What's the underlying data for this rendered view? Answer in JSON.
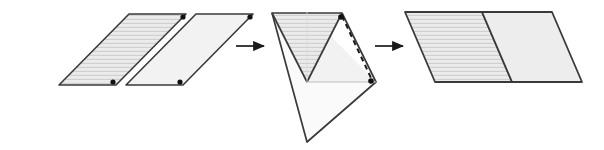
{
  "figure": {
    "type": "geometry-dissection-diagram",
    "caption": "",
    "canvas": {
      "width": 604,
      "height": 150,
      "background": "#ffffff"
    },
    "colors": {
      "outline": "#3a3a3a",
      "fill_plain": "#efefef",
      "fill_hatched": "#e9e9e9",
      "fill_pale": "#f7f7f7",
      "hatch_line": "#c9c9c9",
      "vertex_dot": "#111111",
      "arrow": "#1a1a1a",
      "dashed_line": "#1a1a1a"
    },
    "stages": [
      {
        "id": "stage-1",
        "label": "two separate parallelograms",
        "shapes": [
          {
            "id": "parallelogram-hatched-start",
            "name": "hatched-parallelogram",
            "fill": "hatched",
            "points": "59,85 129,14 186,14 116,85",
            "dots": [
              {
                "name": "vertex-dot-top-right",
                "cx": 183,
                "cy": 17
              },
              {
                "name": "vertex-dot-bottom-right",
                "cx": 113,
                "cy": 82
              }
            ]
          },
          {
            "id": "parallelogram-plain-start",
            "name": "plain-parallelogram",
            "fill": "plain",
            "points": "126,85 196,14 253,14 183,85",
            "dots": [
              {
                "name": "vertex-dot-top-right",
                "cx": 250,
                "cy": 17
              },
              {
                "name": "vertex-dot-bottom-right",
                "cx": 180,
                "cy": 82
              }
            ]
          }
        ]
      },
      {
        "id": "arrow-1",
        "label": "transform arrow one",
        "x1": 236,
        "y1": 46,
        "x2": 266,
        "y2": 46
      },
      {
        "id": "stage-2",
        "label": "rotated overlapping triangles with fold line",
        "shapes": [
          {
            "id": "triangle-pale-lower",
            "name": "pale-lower-triangle",
            "fill": "pale",
            "points": "272,13 376,82 307,142"
          },
          {
            "id": "triangle-plain-right",
            "name": "plain-right-triangle",
            "fill": "plain",
            "points": "307,12 376,82 307,82"
          },
          {
            "id": "triangle-hatched-upper",
            "name": "hatched-upper-triangle",
            "fill": "hatched",
            "points": "272,13 342,13 307,82"
          },
          {
            "id": "outline-diamond",
            "name": "diamond-outline",
            "points": "272,13 342,13 376,82 307,142"
          }
        ],
        "dashed_line": {
          "name": "fold-line",
          "x1": 342,
          "y1": 16,
          "x2": 372,
          "y2": 80,
          "dash": "5,4"
        },
        "dots": [
          {
            "name": "vertex-dot-top",
            "cx": 341,
            "cy": 17
          },
          {
            "name": "vertex-dot-right",
            "cx": 371,
            "cy": 81
          }
        ]
      },
      {
        "id": "arrow-2",
        "label": "transform arrow two",
        "x1": 375,
        "y1": 46,
        "x2": 405,
        "y2": 46
      },
      {
        "id": "stage-3",
        "label": "joined parallelogram result",
        "shapes": [
          {
            "id": "parallelogram-hatched-result",
            "name": "hatched-parallelogram-result",
            "fill": "hatched",
            "points": "405,12 482,12 512,82 435,82"
          },
          {
            "id": "parallelogram-plain-result",
            "name": "plain-parallelogram-result",
            "fill": "plain",
            "points": "482,12 552,12 582,82 512,82"
          }
        ]
      }
    ]
  }
}
